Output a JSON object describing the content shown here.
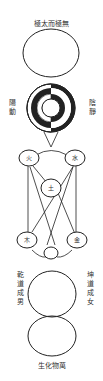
{
  "diagram": {
    "title_top": "極太而極無",
    "title_bottom": "生化物萬",
    "yin_yang": {
      "left_label": "陽動",
      "right_label": "陰靜"
    },
    "five_phases": {
      "fire": "火",
      "water": "水",
      "earth": "土",
      "wood": "木",
      "metal": "金"
    },
    "qian_label": "乾道成男",
    "kun_label": "坤道成女",
    "colors": {
      "ink": "#222222",
      "background": "#ffffff"
    }
  }
}
